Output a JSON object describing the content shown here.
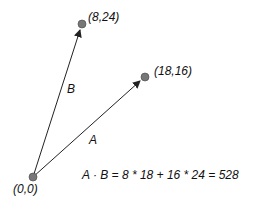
{
  "diagram": {
    "points": {
      "origin": {
        "label": "(0,0)",
        "x": 33,
        "y": 177
      },
      "b_tip": {
        "label": "(8,24)",
        "x": 82,
        "y": 24
      },
      "a_tip": {
        "label": "(18,16)",
        "x": 145,
        "y": 77
      }
    },
    "vectors": {
      "a": {
        "label": "A"
      },
      "b": {
        "label": "B"
      }
    },
    "equation": "A · B = 8 * 18 + 16 * 24 =  528",
    "colors": {
      "point": "#777777",
      "line": "#222222"
    }
  }
}
